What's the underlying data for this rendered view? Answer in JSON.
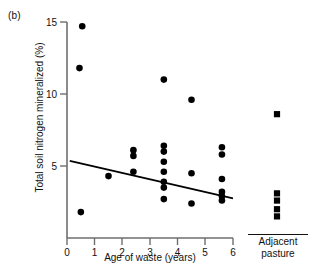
{
  "figure": {
    "panel_label": "(b)",
    "axis_color": "#666666",
    "marker_color": "#000000",
    "line_color": "#000000"
  },
  "chart_data": {
    "type": "scatter",
    "title": "",
    "xlabel": "Age of waste (years)",
    "ylabel": "Total soil nitrogen mineralized (%)",
    "xlim": [
      0,
      6
    ],
    "ylim": [
      0,
      15
    ],
    "xticks": [
      0,
      1,
      2,
      3,
      4,
      5,
      6
    ],
    "xticklabels": [
      "0",
      "1",
      "2",
      "3",
      "4",
      "5",
      "6"
    ],
    "yticks": [
      0,
      5,
      10,
      15
    ],
    "yticklabels": [
      "",
      "5",
      "10",
      "15"
    ],
    "grid": false,
    "legend": "none",
    "series": [
      {
        "name": "Waste sites",
        "marker": "circle",
        "points": [
          [
            0.55,
            14.7
          ],
          [
            0.45,
            11.8
          ],
          [
            0.5,
            1.8
          ],
          [
            1.5,
            4.3
          ],
          [
            2.4,
            6.1
          ],
          [
            2.4,
            5.7
          ],
          [
            2.4,
            4.6
          ],
          [
            3.5,
            11.0
          ],
          [
            3.5,
            6.4
          ],
          [
            3.5,
            6.0
          ],
          [
            3.5,
            5.3
          ],
          [
            3.5,
            4.6
          ],
          [
            3.5,
            3.9
          ],
          [
            3.5,
            3.5
          ],
          [
            3.5,
            2.7
          ],
          [
            4.5,
            9.6
          ],
          [
            4.5,
            4.5
          ],
          [
            4.5,
            2.4
          ],
          [
            5.6,
            6.3
          ],
          [
            5.6,
            5.8
          ],
          [
            5.6,
            4.1
          ],
          [
            5.6,
            3.2
          ],
          [
            5.6,
            2.9
          ],
          [
            5.6,
            2.6
          ]
        ]
      },
      {
        "name": "Adjacent pasture",
        "marker": "square",
        "label_line1": "Adjacent",
        "label_line2": "pasture",
        "values": [
          8.6,
          3.1,
          2.6,
          2.0,
          1.5
        ]
      }
    ],
    "trendline": {
      "description": "fitted regression line",
      "x_start": 0.1,
      "y_start": 5.35,
      "x_end": 6.0,
      "y_end": 2.75
    }
  }
}
